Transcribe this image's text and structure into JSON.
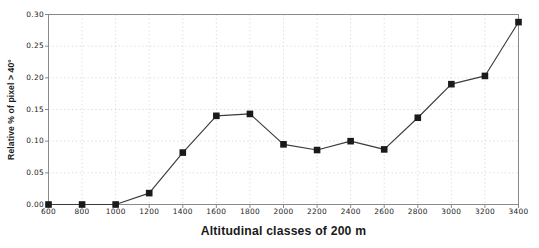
{
  "chart_data": {
    "type": "line",
    "title": "",
    "xlabel": "Altitudinal classes of 200 m",
    "ylabel": "Relative % of pixel > 40°",
    "categories": [
      600,
      800,
      1000,
      1200,
      1400,
      1600,
      1800,
      2000,
      2200,
      2400,
      2600,
      2800,
      3000,
      3200,
      3400
    ],
    "values": [
      0.0,
      0.0,
      0.0,
      0.018,
      0.082,
      0.14,
      0.143,
      0.095,
      0.086,
      0.1,
      0.087,
      0.137,
      0.19,
      0.203,
      0.288
    ],
    "series": [
      {
        "name": "Relative % of pixel > 40°",
        "values": [
          0.0,
          0.0,
          0.0,
          0.018,
          0.082,
          0.14,
          0.143,
          0.095,
          0.086,
          0.1,
          0.087,
          0.137,
          0.19,
          0.203,
          0.288
        ]
      }
    ],
    "xtick_labels": [
      "600",
      "800",
      "1000",
      "1200",
      "1400",
      "1600",
      "1800",
      "2000",
      "2200",
      "2400",
      "2600",
      "2800",
      "3000",
      "3200",
      "3400"
    ],
    "ytick_labels": [
      "0.00",
      "0.05",
      "0.10",
      "0.15",
      "0.20",
      "0.25",
      "0.30"
    ],
    "ytick_values": [
      0.0,
      0.05,
      0.1,
      0.15,
      0.2,
      0.25,
      0.3
    ],
    "ylim": [
      0.0,
      0.3
    ],
    "xlim": [
      600,
      3400
    ],
    "grid": true,
    "grid_style": "dotted",
    "legend": "none",
    "marker": "square",
    "line_color": "#3b3b3b",
    "marker_color": "#1a1a1a",
    "grid_color": "#d8d8d8",
    "axis_color": "#8a8a8a",
    "text_color": "#1c1c1c",
    "background": "#ffffff"
  }
}
